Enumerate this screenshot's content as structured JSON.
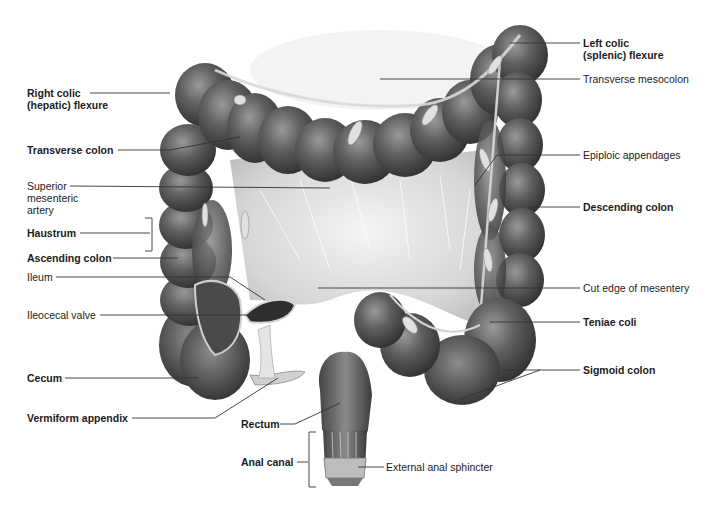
{
  "figure": {
    "colors": {
      "background": "#ffffff",
      "colon_dark": "#3a3a3a",
      "colon_mid": "#5e5e5e",
      "colon_light": "#8a8a8a",
      "mesentery": "#d8d8d8",
      "appendage": "#cfcfcf",
      "label_text": "#1c1c1c",
      "leader_line": "#333333"
    }
  },
  "labels": {
    "left": [
      {
        "id": "right-colic-flexure",
        "lines": [
          "Right colic",
          "(hepatic) flexure"
        ],
        "bold": true
      },
      {
        "id": "transverse-colon",
        "lines": [
          "Transverse colon"
        ],
        "bold": true
      },
      {
        "id": "superior-mesenteric-artery",
        "lines": [
          "Superior",
          "mesenteric",
          "artery"
        ],
        "bold": false
      },
      {
        "id": "haustrum",
        "lines": [
          "Haustrum"
        ],
        "bold": true
      },
      {
        "id": "ascending-colon",
        "lines": [
          "Ascending colon"
        ],
        "bold": true
      },
      {
        "id": "ileum",
        "lines": [
          "Ileum"
        ],
        "bold": false
      },
      {
        "id": "ileocecal-valve",
        "lines": [
          "Ileocecal valve"
        ],
        "bold": false
      },
      {
        "id": "cecum",
        "lines": [
          "Cecum"
        ],
        "bold": true
      },
      {
        "id": "vermiform-appendix",
        "lines": [
          "Vermiform appendix"
        ],
        "bold": true
      }
    ],
    "bottom": [
      {
        "id": "rectum",
        "lines": [
          "Rectum"
        ],
        "bold": true
      },
      {
        "id": "anal-canal",
        "lines": [
          "Anal canal"
        ],
        "bold": true
      },
      {
        "id": "external-anal-sphincter",
        "lines": [
          "External anal sphincter"
        ],
        "bold": false
      }
    ],
    "right": [
      {
        "id": "left-colic-flexure",
        "lines": [
          "Left colic",
          "(splenic) flexure"
        ],
        "bold": true
      },
      {
        "id": "transverse-mesocolon",
        "lines": [
          "Transverse mesocolon"
        ],
        "bold": false
      },
      {
        "id": "epiploic-appendages",
        "lines": [
          "Epiploic appendages"
        ],
        "bold": false
      },
      {
        "id": "descending-colon",
        "lines": [
          "Descending colon"
        ],
        "bold": true
      },
      {
        "id": "cut-edge-of-mesentery",
        "lines": [
          "Cut edge of mesentery"
        ],
        "bold": false
      },
      {
        "id": "teniae-coli",
        "lines": [
          "Teniae coli"
        ],
        "bold": true
      },
      {
        "id": "sigmoid-colon",
        "lines": [
          "Sigmoid colon"
        ],
        "bold": true
      }
    ]
  }
}
